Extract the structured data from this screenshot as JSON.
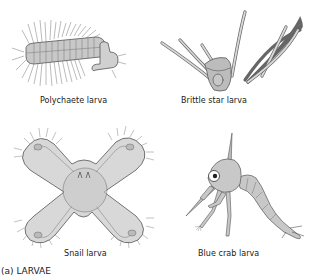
{
  "figure": {
    "panel_label": "(a) LARVAE",
    "colors": {
      "fill": "#c8c8c8",
      "fill_light": "#dcdcdc",
      "outline": "#555555",
      "text": "#1a1a1a",
      "background": "#ffffff"
    },
    "specimens": [
      {
        "name": "polychaete",
        "caption": "Polychaete larva"
      },
      {
        "name": "brittle-star",
        "caption": "Brittle star larva"
      },
      {
        "name": "snail",
        "caption": "Snail larva"
      },
      {
        "name": "blue-crab",
        "caption": "Blue crab larva"
      }
    ]
  }
}
